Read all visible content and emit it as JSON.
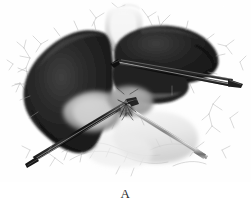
{
  "figure": {
    "caption_label": "A",
    "alt_title": "Surgical illustration of liver with laparoscopic instruments",
    "background_color": "#ffffff",
    "ink_color": "#1a1a1a",
    "midtone_color": "#8a8a8a",
    "highlight_color": "#f2f2f2",
    "line_color": "#9a9a9a",
    "metal_light": "#e8e8e8",
    "metal_dark": "#3a3a3a",
    "anatomy": [
      {
        "name": "left-liver-lobe",
        "tone": "dark",
        "description": "Large dark left hepatic lobe occupying left half of field"
      },
      {
        "name": "right-liver-lobe",
        "tone": "dark",
        "description": "Dark right hepatic lobe sweeping to upper right"
      },
      {
        "name": "falciform-ligament",
        "tone": "light",
        "description": "Pale vertical band at top center between lobes"
      },
      {
        "name": "gallbladder-fossa-highlight",
        "tone": "mid",
        "description": "Pale grey rounded highlight low on left lobe"
      },
      {
        "name": "hilar-plate",
        "tone": "mid",
        "description": "Grey hilar structures at center where instruments converge"
      },
      {
        "name": "vascular-web",
        "tone": "line",
        "description": "Fine branching vessel and adhesion lines across periphery"
      }
    ],
    "instruments": [
      {
        "name": "upper-grasper",
        "tone": "dark",
        "description": "Long dark shafted grasper entering from upper right toward hilum"
      },
      {
        "name": "lower-dissector",
        "tone": "light",
        "description": "Light metal shafted dissector running from hilum to lower right"
      },
      {
        "name": "retractor-blade",
        "tone": "dark",
        "description": "Dark retractor running from hilum to lower left edge"
      }
    ]
  }
}
